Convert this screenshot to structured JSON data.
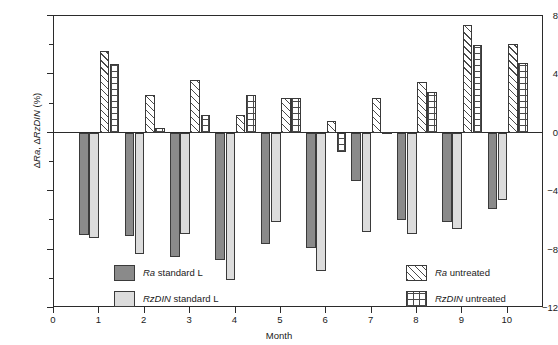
{
  "chart_data": {
    "type": "bar",
    "title": "",
    "xlabel": "Month",
    "ylabel": "ΔRa, ΔRzDIN (%)",
    "categories": [
      "1",
      "2",
      "3",
      "4",
      "5",
      "6",
      "7",
      "8",
      "9",
      "10"
    ],
    "xlim": [
      0,
      10.8
    ],
    "ylim": [
      -12,
      8
    ],
    "yticks": [
      -12,
      -8,
      -4,
      0,
      4,
      8
    ],
    "yticks_minor": [
      -10,
      -6,
      -2,
      2,
      6
    ],
    "xticks": [
      0,
      1,
      2,
      3,
      4,
      5,
      6,
      7,
      8,
      9,
      10
    ],
    "grid": false,
    "legend_position": "inside-bottom-split",
    "series": [
      {
        "name": "Ra standard L",
        "name_italic_prefix": "Ra",
        "name_rest": " standard L",
        "fill": "solid-dark",
        "color": "#8a8a8a",
        "values": [
          -7.0,
          -7.1,
          -8.5,
          -8.7,
          -7.6,
          -7.9,
          -3.3,
          -6.0,
          -6.1,
          -5.2
        ]
      },
      {
        "name": "RzDIN standard L",
        "name_italic_prefix": "RzDIN",
        "name_rest": " standard L",
        "fill": "solid-light",
        "color": "#dcdcdc",
        "values": [
          -7.2,
          -8.3,
          -6.9,
          -10.1,
          -6.1,
          -9.5,
          -6.8,
          -6.9,
          -6.6,
          -4.6
        ]
      },
      {
        "name": "Ra untreated",
        "name_italic_prefix": "Ra",
        "name_rest": " untreated",
        "fill": "diag",
        "color": "#4a4a4a",
        "values": [
          5.6,
          2.6,
          3.6,
          1.2,
          2.4,
          0.8,
          2.4,
          3.5,
          7.4,
          6.1
        ]
      },
      {
        "name": "RzDIN untreated",
        "name_italic_prefix": "RzDIN",
        "name_rest": " untreated",
        "fill": "grid",
        "color": "#4a4a4a",
        "values": [
          4.7,
          0.3,
          1.2,
          2.6,
          2.4,
          -1.3,
          0.05,
          2.8,
          6.0,
          4.8
        ]
      }
    ]
  },
  "legend_left": [
    {
      "italic": "Ra",
      "rest": " standard L",
      "fill": "solid-dark"
    },
    {
      "italic": "RzDIN",
      "rest": " standard L",
      "fill": "solid-light"
    }
  ],
  "legend_right": [
    {
      "italic": "Ra",
      "rest": " untreated",
      "fill": "diag"
    },
    {
      "italic": "RzDIN",
      "rest": " untreated",
      "fill": "grid"
    }
  ],
  "axis": {
    "ylabel_italic_1": "Ra",
    "ylabel_italic_2": "RzDIN",
    "ylabel_pre": "Δ",
    "ylabel_mid": ", Δ",
    "ylabel_post": " (%)",
    "xlabel": "Month"
  }
}
